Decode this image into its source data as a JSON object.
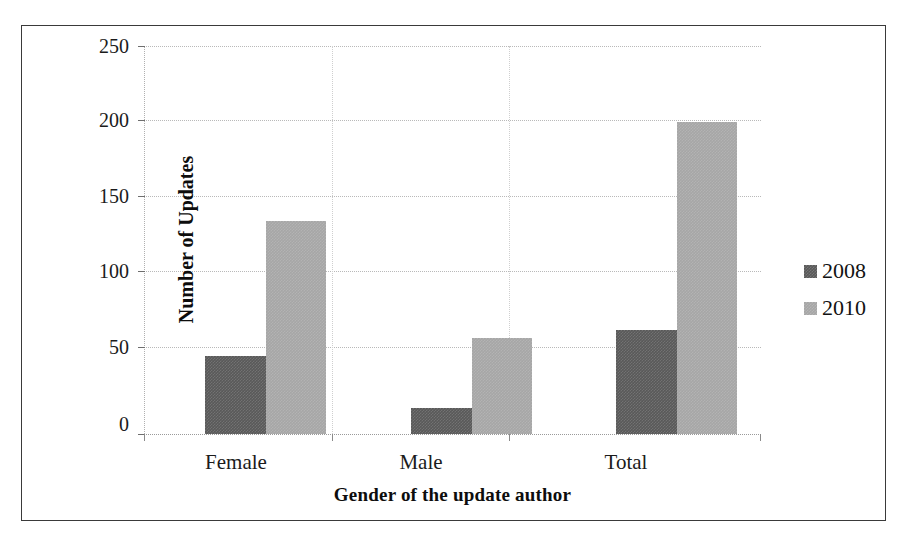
{
  "chart_data": {
    "type": "bar",
    "title": "",
    "xlabel": "Gender of the update author",
    "ylabel": "Number of Updates",
    "categories": [
      "Female",
      "Male",
      "Total"
    ],
    "series": [
      {
        "name": "2008",
        "values": [
          50,
          17,
          67
        ],
        "color": "#595959"
      },
      {
        "name": "2010",
        "values": [
          137,
          62,
          201
        ],
        "color": "#a6a6a6"
      }
    ],
    "ylim": [
      0,
      250
    ],
    "yticks": [
      0,
      50,
      100,
      150,
      200,
      250
    ],
    "ytick_labels": [
      "0",
      "50",
      "100",
      "150",
      "200",
      "250"
    ],
    "grid": true,
    "legend_position": "right",
    "frame": true
  },
  "axes": {
    "y_title": "Number of Updates",
    "x_title": "Gender of the update author",
    "y_tick_labels": [
      "250",
      "200",
      "150",
      "100",
      "50",
      "0"
    ],
    "x_tick_labels": [
      "Female",
      "Male",
      "Total"
    ]
  },
  "legend": {
    "entries": [
      {
        "label": "2008",
        "color": "#595959"
      },
      {
        "label": "2010",
        "color": "#a6a6a6"
      }
    ]
  },
  "colors": {
    "series_2008": "#595959",
    "series_2010": "#a6a6a6",
    "grid": "#b9b9b9",
    "frame": "#3a3a3a",
    "text": "#1b1b1b"
  }
}
